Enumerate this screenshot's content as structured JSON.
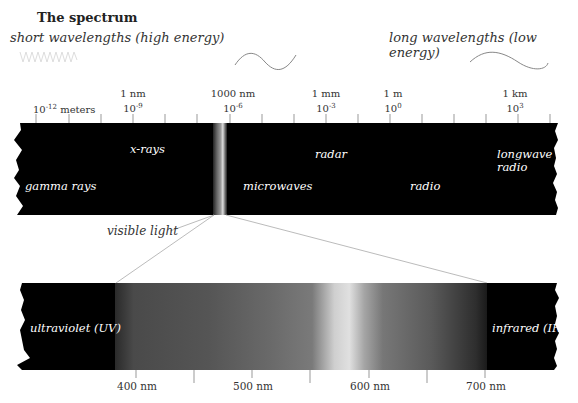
{
  "title": "The spectrum",
  "short_wave_label": "short wavelengths (high energy)",
  "long_wave_label": "long wavelengths (low energy)",
  "icons": {
    "short_wave": "short-wavelength-wave-icon",
    "mid_wave": "medium-wavelength-wave-icon",
    "long_wave": "long-wavelength-wave-icon"
  },
  "scale": [
    {
      "top": "",
      "base": "10",
      "exp": "-12",
      "suffix": " meters"
    },
    {
      "top": "1 nm",
      "base": "10",
      "exp": "-9",
      "suffix": ""
    },
    {
      "top": "1000 nm",
      "base": "10",
      "exp": "-6",
      "suffix": ""
    },
    {
      "top": "1 mm",
      "base": "10",
      "exp": "-3",
      "suffix": ""
    },
    {
      "top": "1 m",
      "base": "10",
      "exp": "0",
      "suffix": ""
    },
    {
      "top": "1 km",
      "base": "10",
      "exp": "3",
      "suffix": ""
    }
  ],
  "bands": {
    "gamma": "gamma rays",
    "xrays": "x-rays",
    "microwaves": "microwaves",
    "radar": "radar",
    "radio": "radio",
    "longwave_1": "longwave",
    "longwave_2": "radio"
  },
  "visible_light_label": "visible light",
  "visible": {
    "uv": "ultraviolet (UV)",
    "ir": "infrared (IR)",
    "ticks": [
      "400 nm",
      "500 nm",
      "600 nm",
      "700 nm"
    ]
  },
  "colors": {
    "band": "#000000",
    "line": "#aaaaaa",
    "spectrum_dark": "#3a3a3a",
    "spectrum_bright": "#d8d8d8"
  }
}
